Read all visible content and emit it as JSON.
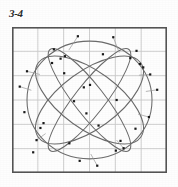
{
  "figure": {
    "label": "3-4",
    "caption": ""
  },
  "colors": {
    "background": "#fefefe",
    "frame_border": "#555555",
    "grid_line": "#c9c9c9",
    "curve": "#6b6b6b",
    "marker": "#1a1a1a"
  },
  "chart_data": {
    "type": "scatter",
    "title": "3-4",
    "xlabel": "",
    "ylabel": "",
    "xlim": [
      0,
      6
    ],
    "ylim": [
      0,
      6
    ],
    "grid": true,
    "grid_x_ticks": [
      0,
      1,
      2,
      3,
      4,
      5,
      6
    ],
    "grid_y_ticks": [
      0,
      1,
      2,
      3,
      4,
      5,
      6
    ],
    "tick_labels_visible": false,
    "legend": null,
    "marker_style": "small filled square",
    "points": [
      {
        "x": 2.55,
        "y": 5.62
      },
      {
        "x": 3.92,
        "y": 5.58
      },
      {
        "x": 1.62,
        "y": 5.08
      },
      {
        "x": 4.82,
        "y": 5.02
      },
      {
        "x": 2.05,
        "y": 4.8
      },
      {
        "x": 1.88,
        "y": 4.7
      },
      {
        "x": 3.52,
        "y": 4.88
      },
      {
        "x": 4.58,
        "y": 4.72
      },
      {
        "x": 0.58,
        "y": 4.18
      },
      {
        "x": 2.02,
        "y": 4.1
      },
      {
        "x": 5.08,
        "y": 4.34
      },
      {
        "x": 5.35,
        "y": 4.05
      },
      {
        "x": 0.3,
        "y": 3.55
      },
      {
        "x": 3.02,
        "y": 3.62
      },
      {
        "x": 5.62,
        "y": 3.42
      },
      {
        "x": 2.4,
        "y": 2.95
      },
      {
        "x": 4.05,
        "y": 3.0
      },
      {
        "x": 0.48,
        "y": 2.5
      },
      {
        "x": 2.88,
        "y": 2.45
      },
      {
        "x": 5.3,
        "y": 2.3
      },
      {
        "x": 1.1,
        "y": 1.85
      },
      {
        "x": 3.35,
        "y": 1.95
      },
      {
        "x": 4.78,
        "y": 1.82
      },
      {
        "x": 0.95,
        "y": 1.35
      },
      {
        "x": 2.22,
        "y": 1.22
      },
      {
        "x": 4.32,
        "y": 1.02
      },
      {
        "x": 4.02,
        "y": 0.92
      },
      {
        "x": 0.82,
        "y": 0.85
      },
      {
        "x": 2.62,
        "y": 0.5
      },
      {
        "x": 3.3,
        "y": 0.3
      },
      {
        "x": 1.55,
        "y": 4.52
      },
      {
        "x": 4.95,
        "y": 4.48
      },
      {
        "x": 2.78,
        "y": 3.52
      },
      {
        "x": 1.22,
        "y": 2.05
      },
      {
        "x": 4.2,
        "y": 1.32
      }
    ],
    "curves": [
      {
        "name": "outer-circle",
        "type": "circle",
        "cx": 3.0,
        "cy": 3.0,
        "r": 2.42
      },
      {
        "name": "ellipse-tilt-a",
        "type": "ellipse",
        "cx": 3.0,
        "cy": 3.0,
        "rx": 2.45,
        "ry": 1.18,
        "rotation_deg": -36
      },
      {
        "name": "ellipse-tilt-b",
        "type": "ellipse",
        "cx": 3.0,
        "cy": 3.0,
        "rx": 2.45,
        "ry": 1.18,
        "rotation_deg": 36
      },
      {
        "name": "ellipse-tilt-c",
        "type": "ellipse",
        "cx": 3.0,
        "cy": 3.0,
        "rx": 2.48,
        "ry": 0.62,
        "rotation_deg": -52
      },
      {
        "name": "ellipse-tilt-d",
        "type": "ellipse",
        "cx": 3.0,
        "cy": 3.0,
        "rx": 2.48,
        "ry": 0.62,
        "rotation_deg": 52
      }
    ],
    "residual_segments": [
      {
        "x1": 2.55,
        "y1": 5.62,
        "x2": 2.2,
        "y2": 5.05
      },
      {
        "x1": 3.92,
        "y1": 5.58,
        "x2": 4.15,
        "y2": 4.95
      },
      {
        "x1": 0.58,
        "y1": 4.18,
        "x2": 1.08,
        "y2": 4.05
      },
      {
        "x1": 5.35,
        "y1": 4.05,
        "x2": 4.92,
        "y2": 4.02
      },
      {
        "x1": 0.3,
        "y1": 3.55,
        "x2": 0.75,
        "y2": 3.4
      },
      {
        "x1": 5.62,
        "y1": 3.42,
        "x2": 5.18,
        "y2": 3.35
      },
      {
        "x1": 5.3,
        "y1": 2.3,
        "x2": 4.88,
        "y2": 2.42
      },
      {
        "x1": 0.95,
        "y1": 1.35,
        "x2": 1.3,
        "y2": 1.62
      },
      {
        "x1": 3.3,
        "y1": 0.3,
        "x2": 3.05,
        "y2": 0.78
      },
      {
        "x1": 4.32,
        "y1": 1.02,
        "x2": 4.05,
        "y2": 1.35
      }
    ]
  }
}
